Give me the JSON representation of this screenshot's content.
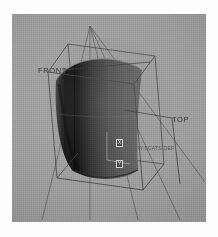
{
  "scene": {
    "kind": "cad-wireframe-surface-render",
    "background_color": "#9b9b9b",
    "viewport": {
      "x": 12,
      "y": 14,
      "width": 194,
      "height": 208
    }
  },
  "labels": {
    "front": "FRONT",
    "top": "TOP",
    "file_tag": "DRW:SCATS.DEF",
    "axis_x": "X",
    "axis_y": "Y"
  },
  "colors": {
    "background": "#9b9b9b",
    "wire": "#3c3c3c",
    "surface_dark": "#0a0a0a",
    "surface_mid": "#4d4d4d",
    "surface_light": "#6d6d6d",
    "label_text": "#2b2b2b",
    "page": "#fdfdfd"
  },
  "geometry": {
    "surface_name": "curved-saddle-patch",
    "bounding_box_name": "wireframe-bounding-box",
    "projection_rays": 5,
    "leader_lines": 2
  }
}
